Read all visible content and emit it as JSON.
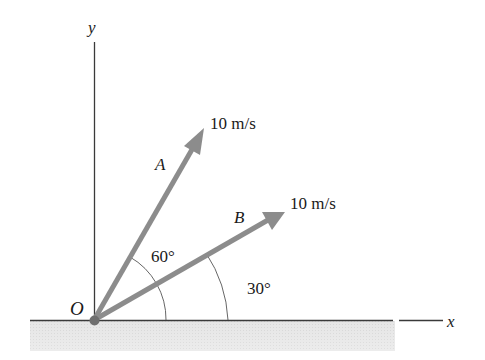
{
  "figure": {
    "type": "vector-diagram",
    "axes": {
      "x_label": "x",
      "y_label": "y",
      "origin_label": "O"
    },
    "vectors": [
      {
        "name": "A",
        "magnitude_label": "10 m/s",
        "angle_deg": 60,
        "angle_label": "60°"
      },
      {
        "name": "B",
        "magnitude_label": "10 m/s",
        "angle_deg": 30,
        "angle_label": "30°"
      }
    ],
    "colors": {
      "arrow": "#8c8c8c",
      "axis": "#3a3a3a",
      "ground": "#e2e2e2",
      "origin_dot": "#6e6e6e",
      "arc": "#555555"
    }
  }
}
